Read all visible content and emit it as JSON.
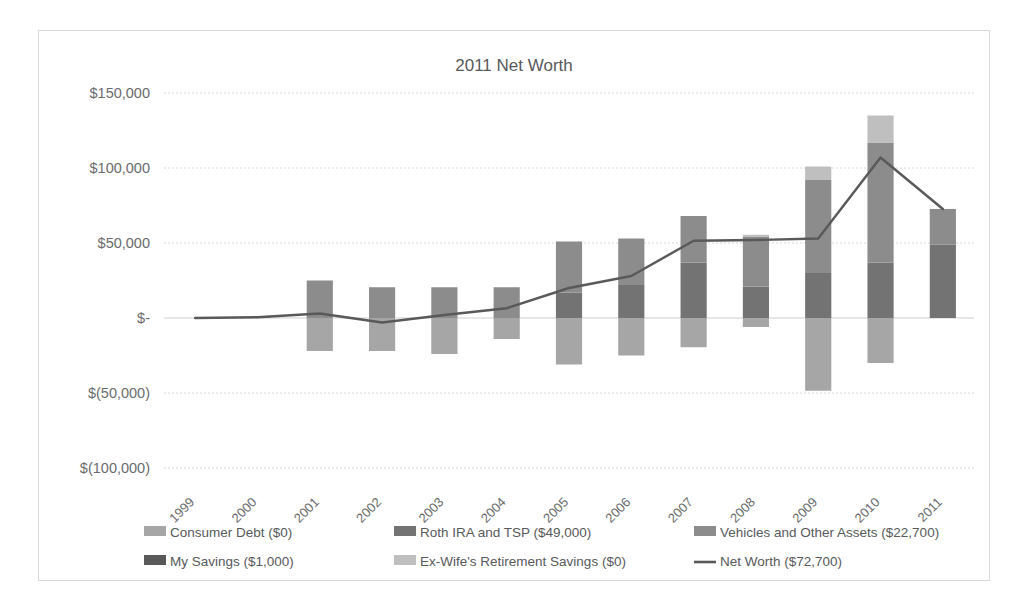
{
  "chart_data": {
    "type": "bar",
    "title": "2011 Net Worth",
    "xlabel": "",
    "ylabel": "",
    "ylim": [
      -100000,
      150000
    ],
    "ytick_values": [
      150000,
      100000,
      50000,
      0,
      -50000,
      -100000
    ],
    "ytick_labels": [
      "$150,000",
      "$100,000",
      "$50,000",
      "$-",
      "$(50,000)",
      "$(100,000)"
    ],
    "grid": true,
    "legend_position": "bottom",
    "stacked": true,
    "categories": [
      "1999",
      "2000",
      "2001",
      "2002",
      "2003",
      "2004",
      "2005",
      "2006",
      "2007",
      "2008",
      "2009",
      "2010",
      "2011"
    ],
    "series": [
      {
        "name": "Consumer Debt ($0)",
        "type": "bar",
        "color": "#a6a6a6",
        "values": [
          0,
          0,
          -22000,
          -22000,
          -24000,
          -14000,
          -31000,
          -25000,
          -19500,
          -6000,
          -48500,
          -30000,
          0
        ]
      },
      {
        "name": "Roth IRA and TSP ($49,000)",
        "type": "bar",
        "color": "#737373",
        "values": [
          0,
          0,
          0,
          0,
          0,
          0,
          17000,
          22000,
          37000,
          21000,
          30000,
          37000,
          49000
        ]
      },
      {
        "name": "Vehicles and Other Assets ($22,700)",
        "type": "bar",
        "color": "#8c8c8c",
        "values": [
          0,
          500,
          25000,
          20500,
          20500,
          20500,
          34000,
          31000,
          31000,
          33000,
          62000,
          80000,
          23700
        ]
      },
      {
        "name": "My Savings ($1,000)",
        "type": "bar",
        "color": "#595959",
        "values": [
          0,
          0,
          0,
          0,
          0,
          0,
          0,
          0,
          0,
          0,
          0,
          0,
          0
        ]
      },
      {
        "name": "Ex-Wife's Retirement Savings ($0)",
        "type": "bar",
        "color": "#bfbfbf",
        "values": [
          0,
          0,
          0,
          0,
          0,
          0,
          0,
          0,
          0,
          1500,
          9000,
          18000,
          0
        ]
      },
      {
        "name": "Net Worth ($72,700)",
        "type": "line",
        "color": "#595959",
        "values": [
          0,
          500,
          3000,
          -3000,
          2000,
          6500,
          20000,
          28000,
          51500,
          52000,
          53000,
          107000,
          72700
        ]
      }
    ]
  },
  "legend": {
    "row1": [
      {
        "label": "Consumer Debt ($0)",
        "color": "#a6a6a6",
        "kind": "swatch"
      },
      {
        "label": "Roth IRA and TSP ($49,000)",
        "color": "#737373",
        "kind": "swatch"
      },
      {
        "label": "Vehicles and Other Assets ($22,700)",
        "color": "#8c8c8c",
        "kind": "swatch"
      }
    ],
    "row2": [
      {
        "label": "My Savings ($1,000)",
        "color": "#595959",
        "kind": "swatch"
      },
      {
        "label": "Ex-Wife's Retirement Savings ($0)",
        "color": "#bfbfbf",
        "kind": "swatch"
      },
      {
        "label": "Net Worth ($72,700)",
        "color": "#595959",
        "kind": "line"
      }
    ]
  },
  "colors": {
    "background": "#ffffff",
    "border": "#d9d9d9",
    "grid": "#d6d6d6",
    "text": "#58595b"
  }
}
